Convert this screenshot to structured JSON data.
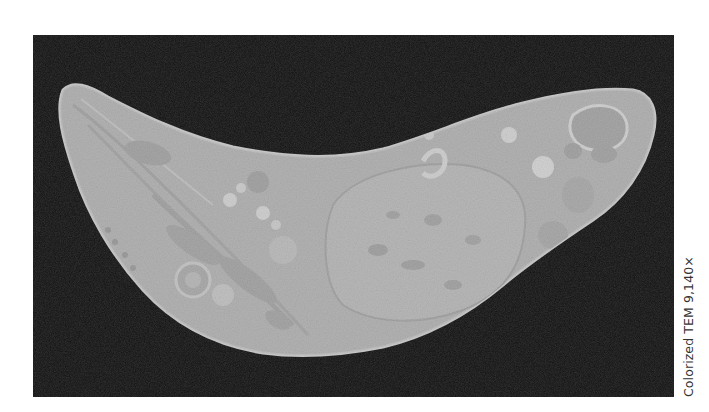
{
  "figure": {
    "background_color": "#0d0d0d",
    "cell_color": "#a9a9a9",
    "caption": "Colorized TEM 9,140×"
  }
}
